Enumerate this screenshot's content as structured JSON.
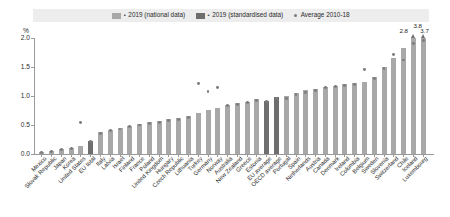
{
  "legend": {
    "separator": "▪",
    "entries": [
      {
        "label": "2019 (national data)",
        "color": "#a8a8a8",
        "marker": "square"
      },
      {
        "label": "2019 (standardised data)",
        "color": "#6e6e6e",
        "marker": "square"
      },
      {
        "label": "Average 2010-18",
        "color": "#7c7c7c",
        "marker": "dot"
      }
    ]
  },
  "axis": {
    "y_unit": "%",
    "y_ticks": [
      "0.0",
      "0.5",
      "1.0",
      "1.5",
      "2.0"
    ]
  },
  "chart_data": {
    "type": "bar",
    "title": "",
    "subtitle": "",
    "xlabel": "",
    "ylabel": "%",
    "ylim": [
      0.0,
      2.0
    ],
    "grid": false,
    "legend_position": "top",
    "categories": [
      "Mexico",
      "Slovak Republic",
      "Japan",
      "Korea",
      "United States",
      "EU total",
      "Italy",
      "Latvia",
      "Israel",
      "Finland",
      "France",
      "Poland",
      "United Kingdom",
      "Hungary",
      "Czech Republic",
      "Lithuania",
      "Turkey",
      "Germany",
      "Norway",
      "Australia",
      "New Zealand",
      "Greece",
      "Estonia",
      "EU average",
      "OECD average",
      "Portugal",
      "Spain",
      "Netherlands",
      "Austria",
      "Canada",
      "Denmark",
      "Ireland",
      "Colombia",
      "Belgium",
      "Sweden",
      "Slovenia",
      "Switzerland",
      "Chile",
      "Iceland",
      "Luxembourg"
    ],
    "series": [
      {
        "name": "2019 (national data)",
        "color": "#a8a8a8",
        "values": [
          0.03,
          0.05,
          0.08,
          0.1,
          0.14,
          null,
          0.38,
          0.42,
          0.45,
          0.48,
          0.52,
          0.55,
          0.57,
          0.6,
          0.62,
          0.65,
          0.7,
          0.76,
          0.8,
          0.84,
          0.88,
          0.9,
          0.95,
          null,
          null,
          1.0,
          1.05,
          1.1,
          1.12,
          1.16,
          1.18,
          1.2,
          1.22,
          1.25,
          1.32,
          1.5,
          1.65,
          1.82,
          2.0,
          2.0
        ]
      },
      {
        "name": "2019 (standardised data)",
        "color": "#6e6e6e",
        "values": [
          null,
          null,
          null,
          null,
          null,
          0.22,
          null,
          null,
          null,
          null,
          null,
          null,
          null,
          null,
          null,
          null,
          null,
          null,
          null,
          null,
          null,
          null,
          null,
          0.92,
          0.98,
          null,
          null,
          null,
          null,
          null,
          null,
          null,
          null,
          null,
          null,
          null,
          null,
          null,
          null,
          null
        ]
      }
    ],
    "average_2010_18": {
      "name": "Average 2010-18",
      "color": "#7c7c7c",
      "values": [
        0.02,
        0.04,
        0.07,
        0.09,
        0.55,
        0.21,
        0.36,
        0.4,
        0.43,
        0.47,
        0.5,
        0.52,
        0.55,
        0.58,
        0.6,
        0.63,
        1.22,
        1.08,
        1.14,
        0.84,
        0.85,
        0.88,
        0.92,
        0.9,
        0.95,
        0.96,
        1.02,
        1.06,
        1.1,
        1.14,
        1.16,
        1.18,
        1.2,
        1.45,
        1.3,
        1.48,
        1.72,
        1.62,
        1.9,
        1.95
      ]
    },
    "overflow_labels": [
      {
        "category": "Iceland",
        "value": "2.8",
        "position": "left"
      },
      {
        "category": "Iceland",
        "value": "3.8",
        "position": "above-arrow"
      },
      {
        "category": "Luxembourg",
        "value": "3.7",
        "position": "right"
      }
    ]
  }
}
